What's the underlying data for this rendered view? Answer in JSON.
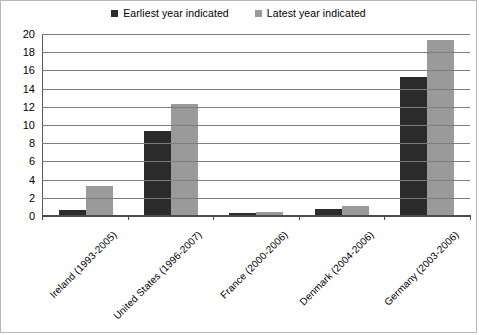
{
  "chart_data": {
    "type": "bar",
    "title": "",
    "subtitle": "",
    "xlabel": "",
    "ylabel": "",
    "ylim": [
      0,
      20
    ],
    "ytick_step": 2,
    "yticks": [
      20,
      18,
      16,
      14,
      12,
      10,
      8,
      6,
      4,
      2,
      0
    ],
    "grid": "horizontal",
    "legend_position": "top-center",
    "categories": [
      "Ireland (1993-2005)",
      "United States (1996-2007)",
      "France (2000-2006)",
      "Denmark (2004-2006)",
      "Germany (2003-2006)"
    ],
    "series": [
      {
        "name": "Earliest year indicated",
        "color": "#2b2b2b",
        "values": [
          0.6,
          9.3,
          0.25,
          0.7,
          15.2
        ]
      },
      {
        "name": "Latest year indicated",
        "color": "#9a9a9a",
        "values": [
          3.2,
          12.3,
          0.35,
          1.0,
          19.3
        ]
      }
    ]
  },
  "legend": {
    "items": [
      {
        "label": "Earliest year indicated",
        "color": "#2b2b2b"
      },
      {
        "label": "Latest year indicated",
        "color": "#9a9a9a"
      }
    ]
  },
  "colors": {
    "earliest_bar": "#2b2b2b",
    "latest_bar": "#9a9a9a",
    "gridline": "#7d7d7d",
    "axis": "#4a4a4a",
    "background": "#ffffff",
    "border": "#b9b9b9"
  }
}
